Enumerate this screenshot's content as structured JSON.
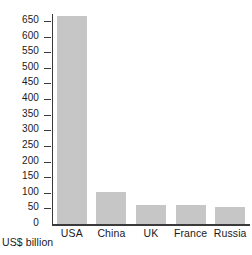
{
  "chart_data": {
    "type": "bar",
    "title": "",
    "subtitle": "",
    "xlabel": "US$ billion",
    "ylabel": "",
    "categories": [
      "USA",
      "China",
      "UK",
      "France",
      "Russia"
    ],
    "values": [
      665,
      102,
      62,
      62,
      55
    ],
    "series": [
      {
        "name": "Military expenditure",
        "values": [
          665,
          102,
          62,
          62,
          55
        ]
      }
    ],
    "ylim": [
      0,
      675
    ],
    "ytick_values": [
      0,
      50,
      100,
      150,
      200,
      250,
      300,
      350,
      400,
      450,
      500,
      550,
      600,
      650
    ],
    "ytick_labels": [
      "0",
      "50",
      "100",
      "150",
      "200",
      "250",
      "300",
      "350",
      "400",
      "450",
      "500",
      "550",
      "600",
      "650"
    ],
    "grid": false,
    "legend": false,
    "legend_position": "none",
    "bar_color": "#c6c6c6",
    "axis_color": "#3a3a3a",
    "background_color": "#ffffff",
    "annotations": []
  },
  "axis": {
    "unit_caption": "US$ billion"
  }
}
